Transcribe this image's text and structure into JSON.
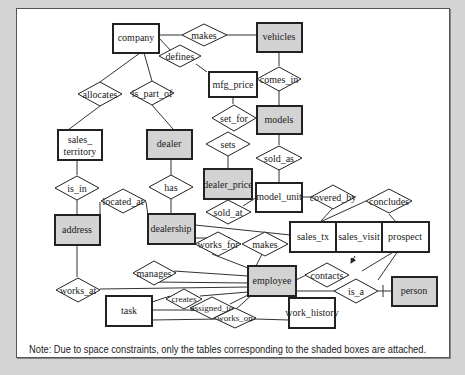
{
  "diagram": {
    "type": "ER diagram",
    "colors": {
      "background": "#d4d4d4",
      "canvas": "#ffffff",
      "shaded_entity": "#d3d3d3",
      "unshaded_entity": "#ffffff",
      "line": "#222222"
    },
    "entities": [
      {
        "id": "company",
        "label": "company",
        "shaded": false
      },
      {
        "id": "vehicles",
        "label": "vehicles",
        "shaded": true
      },
      {
        "id": "mfg_price",
        "label": "mfg_price",
        "shaded": false
      },
      {
        "id": "models",
        "label": "models",
        "shaded": true
      },
      {
        "id": "sales_territory",
        "label": "sales_ territory",
        "shaded": false
      },
      {
        "id": "dealer",
        "label": "dealer",
        "shaded": true
      },
      {
        "id": "dealer_price",
        "label": "dealer_price",
        "shaded": true
      },
      {
        "id": "model_unit",
        "label": "model_unit",
        "shaded": false
      },
      {
        "id": "address",
        "label": "address",
        "shaded": true
      },
      {
        "id": "dealership",
        "label": "dealership",
        "shaded": true
      },
      {
        "id": "sales_tx",
        "label": "sales_tx",
        "shaded": false
      },
      {
        "id": "sales_visit",
        "label": "sales_visit",
        "shaded": false
      },
      {
        "id": "prospect",
        "label": "prospect",
        "shaded": false
      },
      {
        "id": "employee",
        "label": "employee",
        "shaded": true
      },
      {
        "id": "person",
        "label": "person",
        "shaded": true
      },
      {
        "id": "task",
        "label": "task",
        "shaded": false
      },
      {
        "id": "work_history",
        "label": "work_history",
        "shaded": false
      }
    ],
    "relationships": [
      {
        "id": "makes_1",
        "label": "makes",
        "connects": [
          "company",
          "vehicles"
        ]
      },
      {
        "id": "defines",
        "label": "defines",
        "connects": [
          "company",
          "mfg_price"
        ]
      },
      {
        "id": "comes_in",
        "label": "comes_in",
        "connects": [
          "vehicles",
          "models"
        ]
      },
      {
        "id": "allocates",
        "label": "allocates",
        "connects": [
          "company",
          "sales_territory"
        ]
      },
      {
        "id": "is_part_of",
        "label": "is_part_of",
        "connects": [
          "company",
          "dealer"
        ]
      },
      {
        "id": "set_for",
        "label": "set_for",
        "connects": [
          "mfg_price",
          "models"
        ]
      },
      {
        "id": "sets",
        "label": "sets",
        "connects": [
          "dealer",
          "dealer_price"
        ]
      },
      {
        "id": "sold_as",
        "label": "sold_as",
        "connects": [
          "models",
          "model_unit"
        ]
      },
      {
        "id": "is_in",
        "label": "is_in",
        "connects": [
          "sales_territory",
          "address"
        ]
      },
      {
        "id": "has",
        "label": "has",
        "connects": [
          "dealer",
          "dealership"
        ]
      },
      {
        "id": "located_at",
        "label": "located_at",
        "connects": [
          "address",
          "dealership"
        ]
      },
      {
        "id": "sold_at",
        "label": "sold_at",
        "connects": [
          "dealer_price",
          "model_unit"
        ]
      },
      {
        "id": "covered_by",
        "label": "covered_by",
        "connects": [
          "model_unit",
          "sales_tx"
        ]
      },
      {
        "id": "concludes",
        "label": "concludes",
        "connects": [
          "sales_tx",
          "prospect"
        ]
      },
      {
        "id": "works_for",
        "label": "works_for",
        "connects": [
          "dealership",
          "employee"
        ]
      },
      {
        "id": "makes_2",
        "label": "makes",
        "connects": [
          "dealership",
          "employee",
          "sales_tx"
        ]
      },
      {
        "id": "manages",
        "label": "manages",
        "connects": [
          "employee",
          "employee"
        ]
      },
      {
        "id": "works_at",
        "label": "works_at",
        "connects": [
          "address",
          "employee"
        ]
      },
      {
        "id": "contacts",
        "label": "contacts",
        "connects": [
          "employee",
          "sales_visit",
          "prospect"
        ]
      },
      {
        "id": "is_a",
        "label": "is_a",
        "connects": [
          "prospect",
          "person"
        ]
      },
      {
        "id": "creates",
        "label": "creates",
        "connects": [
          "task",
          "employee"
        ]
      },
      {
        "id": "assigned_to",
        "label": "assigned_to",
        "connects": [
          "task",
          "employee"
        ]
      },
      {
        "id": "works_on",
        "label": "works_on",
        "connects": [
          "task",
          "employee",
          "work_history"
        ]
      }
    ]
  },
  "note": "Note: Due to space constraints, only the tables corresponding to the shaded boxes are attached."
}
